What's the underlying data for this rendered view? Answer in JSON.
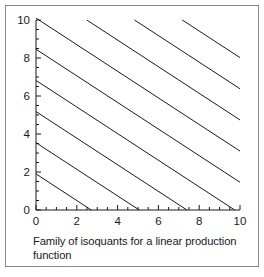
{
  "figure": {
    "caption": "Family of isoquants for a linear production function",
    "border_color": "#8a8a8a",
    "background": "#ffffff"
  },
  "chart_data": {
    "type": "line",
    "title": "",
    "subtitle": "",
    "xlabel": "",
    "ylabel": "",
    "xlim": [
      0,
      10
    ],
    "ylim": [
      0,
      10
    ],
    "grid": false,
    "legend": null,
    "legend_position": "none",
    "line_color": "#1a1a1a",
    "line_width": 1,
    "x_ticks": [
      0,
      2,
      4,
      6,
      8,
      10
    ],
    "x_tick_labels": [
      "0",
      "2",
      "4",
      "6",
      "8",
      "10"
    ],
    "x_minor_tick_step": 0.5,
    "y_ticks": [
      0,
      2,
      4,
      6,
      8,
      10
    ],
    "y_tick_labels": [
      "0",
      "2",
      "4",
      "6",
      "8",
      "10"
    ],
    "y_minor_tick_step": 0.5,
    "slope": -0.7,
    "intercept_step": 1.64,
    "series": [
      {
        "name": "isoquant-1",
        "intercept": 1.9,
        "x": [
          0,
          2.71
        ],
        "y": [
          1.9,
          0
        ]
      },
      {
        "name": "isoquant-2",
        "intercept": 3.54,
        "x": [
          0,
          5.06
        ],
        "y": [
          3.54,
          0
        ]
      },
      {
        "name": "isoquant-3",
        "intercept": 5.18,
        "x": [
          0,
          7.4
        ],
        "y": [
          5.18,
          0
        ]
      },
      {
        "name": "isoquant-4",
        "intercept": 6.82,
        "x": [
          0,
          9.74
        ],
        "y": [
          6.82,
          0
        ]
      },
      {
        "name": "isoquant-5",
        "intercept": 8.46,
        "x": [
          0,
          10
        ],
        "y": [
          8.46,
          1.46
        ]
      },
      {
        "name": "isoquant-6",
        "intercept": 10.1,
        "x": [
          0,
          10
        ],
        "y": [
          10.1,
          3.1
        ]
      },
      {
        "name": "isoquant-7",
        "intercept": 11.74,
        "x": [
          2.49,
          10
        ],
        "y": [
          10,
          4.74
        ]
      },
      {
        "name": "isoquant-8",
        "intercept": 13.38,
        "x": [
          4.83,
          10
        ],
        "y": [
          10,
          6.38
        ]
      },
      {
        "name": "isoquant-9",
        "intercept": 15.02,
        "x": [
          7.17,
          10
        ],
        "y": [
          10,
          8.02
        ]
      }
    ]
  }
}
